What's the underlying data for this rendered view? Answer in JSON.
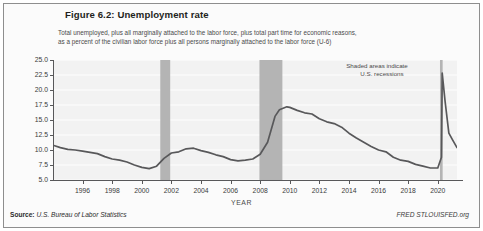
{
  "figure": {
    "title": "Figure 6.2: Unemployment rate",
    "subtitle_line1": "Total unemployed, plus all marginally attached to the labor force, plus total part time for economic reasons,",
    "subtitle_line2": "as a percent of the civilian labor force plus all persons marginally attached to the labor force (U-6)",
    "annotation_line1": "Shaded areas indicate",
    "annotation_line2": "U.S. recessions",
    "source_key": "Source:",
    "source_value": "U.S. Bureau of Labor Statistics",
    "credit": "FRED STLOUISFED.org"
  },
  "colors": {
    "line": "#58585a",
    "plot_background": "#f2f2f2",
    "gridline": "#ffffff",
    "recession_band": "#b4b4b4",
    "axis": "#58585a",
    "title_text": "#231f20",
    "body_text": "#4a4a4a",
    "figure_border": "#8e8e8e"
  },
  "chart_data": {
    "type": "line",
    "title": "Figure 6.2: Unemployment rate",
    "subtitle": "Total unemployed, plus all marginally attached to the labor force, plus total part time for economic reasons, as a percent of the civilian labor force plus all persons marginally attached to the labor force (U-6)",
    "xlabel": "YEAR",
    "ylabel": "PERCENT (%)",
    "xlim": [
      1994.0,
      2021.3
    ],
    "ylim": [
      5.0,
      25.0
    ],
    "ytick_labels": [
      "25.0",
      "22.5",
      "20.0",
      "17.5",
      "15.0",
      "12.5",
      "10.0",
      "7.5",
      "5.0"
    ],
    "ytick_values": [
      25.0,
      22.5,
      20.0,
      17.5,
      15.0,
      12.5,
      10.0,
      7.5,
      5.0
    ],
    "xtick_labels": [
      "1996",
      "1998",
      "2000",
      "2002",
      "2004",
      "2006",
      "2008",
      "2010",
      "2012",
      "2014",
      "2016",
      "2018",
      "2020"
    ],
    "xtick_values": [
      1996,
      1998,
      2000,
      2002,
      2004,
      2006,
      2008,
      2010,
      2012,
      2014,
      2016,
      2018,
      2020
    ],
    "grid": "horizontal",
    "legend": "none",
    "series": [
      {
        "name": "Unemployment rate (U-6)",
        "x": [
          1994.0,
          1994.5,
          1995.0,
          1995.5,
          1996.0,
          1996.5,
          1997.0,
          1997.5,
          1998.0,
          1998.5,
          1999.0,
          1999.5,
          2000.0,
          2000.5,
          2001.0,
          2001.5,
          2002.0,
          2002.5,
          2003.0,
          2003.5,
          2004.0,
          2004.5,
          2005.0,
          2005.5,
          2006.0,
          2006.5,
          2007.0,
          2007.5,
          2008.0,
          2008.5,
          2009.0,
          2009.3,
          2009.8,
          2010.0,
          2010.5,
          2011.0,
          2011.5,
          2012.0,
          2012.5,
          2013.0,
          2013.5,
          2014.0,
          2014.5,
          2015.0,
          2015.5,
          2016.0,
          2016.5,
          2017.0,
          2017.5,
          2018.0,
          2018.5,
          2019.0,
          2019.5,
          2020.0,
          2020.25,
          2020.3,
          2020.5,
          2020.75,
          2021.0,
          2021.3
        ],
        "y": [
          10.8,
          10.4,
          10.1,
          10.0,
          9.8,
          9.6,
          9.4,
          8.9,
          8.5,
          8.3,
          8.0,
          7.5,
          7.1,
          6.9,
          7.3,
          8.6,
          9.5,
          9.7,
          10.2,
          10.3,
          9.9,
          9.6,
          9.2,
          8.9,
          8.4,
          8.2,
          8.3,
          8.5,
          9.3,
          11.3,
          15.6,
          16.7,
          17.2,
          17.1,
          16.6,
          16.2,
          16.0,
          15.2,
          14.7,
          14.4,
          13.8,
          12.8,
          12.0,
          11.3,
          10.6,
          10.0,
          9.7,
          8.8,
          8.3,
          8.1,
          7.6,
          7.3,
          7.0,
          7.0,
          8.8,
          22.8,
          18.0,
          12.8,
          11.7,
          10.4
        ]
      }
    ],
    "peak_annotations": [
      {
        "label": "2009-2010 peak",
        "x": 2009.8,
        "y": 17.2
      },
      {
        "label": "2020 COVID peak",
        "x": 2020.3,
        "y": 22.8
      },
      {
        "label": "2000 trough",
        "x": 2000.5,
        "y": 6.9
      },
      {
        "label": "2019 trough",
        "x": 2019.5,
        "y": 7.0
      }
    ],
    "recession_bands": [
      {
        "label": "2001 recession",
        "start": 2001.25,
        "end": 2001.92
      },
      {
        "label": "Great Recession",
        "start": 2007.95,
        "end": 2009.5
      },
      {
        "label": "COVID-19 recession",
        "start": 2020.15,
        "end": 2020.33
      }
    ]
  }
}
